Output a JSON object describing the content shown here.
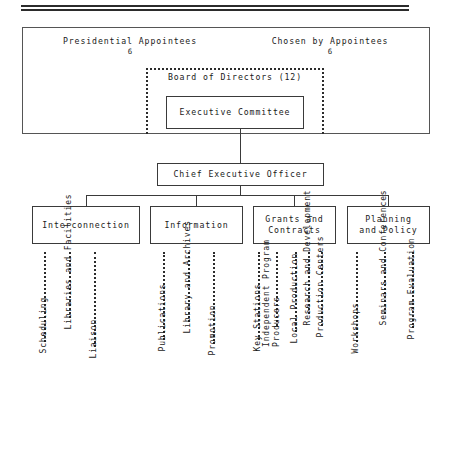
{
  "document": {
    "type": "organization-chart",
    "title": "Corporation for Public Broadcasting Organization Chart"
  },
  "governance": {
    "left_header": "Presidential Appointees",
    "left_count": "6",
    "right_header": "Chosen by Appointees",
    "right_count": "6",
    "board_label": "Board of Directors (12)",
    "executive_committee": "Executive Committee"
  },
  "executive": {
    "ceo": "Chief Executive Officer"
  },
  "departments": [
    {
      "name": "Interconnection",
      "left": 32,
      "width": 108,
      "functions": [
        {
          "label": "Scheduling",
          "leader_x": 44,
          "dot_height": 90
        },
        {
          "label": "Libraries and Facilities",
          "leader_x": 69,
          "dot_height": 66
        },
        {
          "label": "Liaison",
          "leader_x": 94,
          "dot_height": 95
        }
      ]
    },
    {
      "name": "Information",
      "left": 150,
      "width": 93,
      "functions": [
        {
          "label": "Publications",
          "leader_x": 163,
          "dot_height": 88
        },
        {
          "label": "Library and Archives",
          "leader_x": 188,
          "dot_height": 70
        },
        {
          "label": "Promotion",
          "leader_x": 213,
          "dot_height": 92
        }
      ]
    },
    {
      "name": "Grants and\nContracts",
      "left": 253,
      "width": 83,
      "functions": [
        {
          "label": "Key Stations",
          "leader_x": 258,
          "dot_height": 88
        },
        {
          "label": "Independent Program\nProducers",
          "leader_x": 276,
          "dot_height": 74
        },
        {
          "label": "Local Production",
          "leader_x": 295,
          "dot_height": 80
        },
        {
          "label": "Research and Development",
          "leader_x": 308,
          "dot_height": 62
        },
        {
          "label": "Production Centers",
          "leader_x": 321,
          "dot_height": 74
        }
      ]
    },
    {
      "name": "Planning\nand Policy",
      "left": 347,
      "width": 83,
      "functions": [
        {
          "label": "Workshops",
          "leader_x": 356,
          "dot_height": 90
        },
        {
          "label": "Seminars and Conferences",
          "leader_x": 384,
          "dot_height": 62
        },
        {
          "label": "Program Evaluation",
          "leader_x": 412,
          "dot_height": 76
        }
      ]
    }
  ]
}
